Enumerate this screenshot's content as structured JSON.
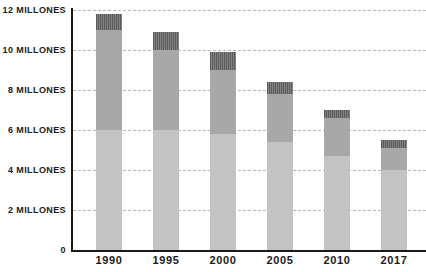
{
  "chart_data": {
    "type": "bar",
    "title": "",
    "xlabel": "",
    "ylabel": "",
    "stacked": true,
    "grid": true,
    "legend": "none",
    "ylim": [
      0,
      12000000
    ],
    "y_tick_labels": [
      "12 MILLONES",
      "10 MILLONES",
      "8 MILLONES",
      "6 MILLONES",
      "4 MILLONES",
      "2 MILLONES",
      "0"
    ],
    "y_tick_values": [
      12000000,
      10000000,
      8000000,
      6000000,
      4000000,
      2000000,
      0
    ],
    "categories": [
      "1990",
      "1995",
      "2000",
      "2005",
      "2010",
      "2017"
    ],
    "totals": [
      11.8,
      10.9,
      9.9,
      8.4,
      7.0,
      5.5
    ],
    "unit": "millones",
    "series": [
      {
        "name": "segment-bottom",
        "color": "#c3c3c3",
        "values": [
          6.0,
          6.0,
          5.8,
          5.4,
          4.7,
          4.0
        ]
      },
      {
        "name": "segment-middle",
        "color": "#a8a8a8",
        "values": [
          5.0,
          4.0,
          3.2,
          2.4,
          1.9,
          1.1
        ]
      },
      {
        "name": "segment-top",
        "color": "#6e6e6e",
        "values": [
          0.8,
          0.9,
          0.9,
          0.6,
          0.4,
          0.4
        ]
      }
    ],
    "bars": [
      {
        "category": "1990",
        "total": 11.8,
        "bottom": 6.0,
        "middle": 5.0,
        "top": 0.8
      },
      {
        "category": "1995",
        "total": 10.9,
        "bottom": 6.0,
        "middle": 4.0,
        "top": 0.9
      },
      {
        "category": "2000",
        "total": 9.9,
        "bottom": 5.8,
        "middle": 3.2,
        "top": 0.9
      },
      {
        "category": "2005",
        "total": 8.4,
        "bottom": 5.4,
        "middle": 2.4,
        "top": 0.6
      },
      {
        "category": "2010",
        "total": 7.0,
        "bottom": 4.7,
        "middle": 1.9,
        "top": 0.4
      },
      {
        "category": "2017",
        "total": 5.5,
        "bottom": 4.0,
        "middle": 1.1,
        "top": 0.4
      }
    ]
  }
}
